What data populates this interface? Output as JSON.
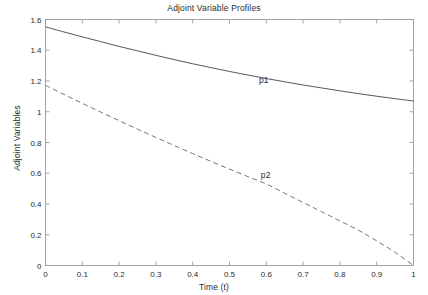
{
  "chart_data": {
    "type": "line",
    "title": "Adjoint Variable Profiles",
    "xlabel": "Time (t)",
    "ylabel": "Adjoint Variables",
    "xlim": [
      0,
      1
    ],
    "ylim": [
      0,
      1.6
    ],
    "grid": false,
    "legend_position": "inline-annotation",
    "xticks": [
      "0",
      "0.1",
      "0.2",
      "0.3",
      "0.4",
      "0.5",
      "0.6",
      "0.7",
      "0.8",
      "0.9",
      "1"
    ],
    "xtick_values": [
      0,
      0.1,
      0.2,
      0.3,
      0.4,
      0.5,
      0.6,
      0.7,
      0.8,
      0.9,
      1
    ],
    "yticks": [
      "0",
      "0.2",
      "0.4",
      "0.6",
      "0.8",
      "1",
      "1.2",
      "1.4",
      "1.6"
    ],
    "ytick_values": [
      0,
      0.2,
      0.4,
      0.6,
      0.8,
      1,
      1.2,
      1.4,
      1.6
    ],
    "x": [
      0,
      0.05,
      0.1,
      0.15,
      0.2,
      0.25,
      0.3,
      0.35,
      0.4,
      0.45,
      0.5,
      0.55,
      0.6,
      0.65,
      0.7,
      0.75,
      0.8,
      0.85,
      0.9,
      0.95,
      1
    ],
    "series": [
      {
        "name": "p1",
        "style": "solid",
        "color": "#4d4d4d",
        "annotation": "p1",
        "annotation_x": 0.58,
        "annotation_y": 1.2,
        "values": [
          1.552,
          1.519,
          1.487,
          1.456,
          1.425,
          1.396,
          1.367,
          1.339,
          1.312,
          1.287,
          1.262,
          1.239,
          1.216,
          1.195,
          1.174,
          1.155,
          1.136,
          1.118,
          1.101,
          1.085,
          1.07
        ]
      },
      {
        "name": "p2",
        "style": "dashed",
        "color": "#6e6e6e",
        "annotation": "p2",
        "annotation_x": 0.585,
        "annotation_y": 0.585,
        "values": [
          1.172,
          1.113,
          1.055,
          0.998,
          0.942,
          0.887,
          0.833,
          0.78,
          0.728,
          0.677,
          0.627,
          0.578,
          0.53,
          0.47,
          0.41,
          0.35,
          0.29,
          0.23,
          0.16,
          0.085,
          0.0
        ]
      }
    ]
  },
  "axes": {
    "frame_color": "#9a9a9a",
    "background": "#ffffff"
  }
}
